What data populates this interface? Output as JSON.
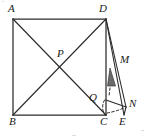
{
  "figure": {
    "width": 146,
    "height": 138,
    "background_color": "#ffffff",
    "stroke_color": "#2b2b2b",
    "shade_color": "#6b6b6b",
    "labels": {
      "a": "A",
      "b": "B",
      "c": "C",
      "d": "D",
      "e": "E",
      "m": "M",
      "n": "N",
      "p": "P",
      "q": "Q"
    },
    "points": {
      "A": {
        "x": 13,
        "y": 19
      },
      "B": {
        "x": 13,
        "y": 115
      },
      "C": {
        "x": 106,
        "y": 115
      },
      "D": {
        "x": 106,
        "y": 19
      },
      "E": {
        "x": 124,
        "y": 115
      },
      "N": {
        "x": 126,
        "y": 107
      },
      "P": {
        "x": 59.5,
        "y": 67
      },
      "Q": {
        "x": 106,
        "y": 100
      },
      "M": {
        "x": 117,
        "y": 76
      }
    },
    "label_positions": {
      "A": {
        "x": 8,
        "y": 4
      },
      "B": {
        "x": 9,
        "y": 118
      },
      "C": {
        "x": 101,
        "y": 118
      },
      "D": {
        "x": 101,
        "y": 4
      },
      "E": {
        "x": 120,
        "y": 118
      },
      "M": {
        "x": 121,
        "y": 55
      },
      "N": {
        "x": 129,
        "y": 99
      },
      "P": {
        "x": 58,
        "y": 49
      },
      "Q": {
        "x": 90,
        "y": 93
      }
    },
    "solid_segments": [
      {
        "name": "side-AB",
        "from": "A",
        "to": "B"
      },
      {
        "name": "side-BC",
        "from": "B",
        "to": "C"
      },
      {
        "name": "side-CD",
        "from": "C",
        "to": "D"
      },
      {
        "name": "side-DA",
        "from": "D",
        "to": "A"
      },
      {
        "name": "diagonal-AC",
        "from": "A",
        "to": "C"
      },
      {
        "name": "diagonal-BD",
        "from": "B",
        "to": "D"
      },
      {
        "name": "segment-DE",
        "from": "D",
        "to": "E"
      },
      {
        "name": "segment-DN",
        "from": "D",
        "to": "N"
      },
      {
        "name": "segment-NE",
        "from": "N",
        "to": "E"
      },
      {
        "name": "segment-QN",
        "from": "Q",
        "to": "N"
      }
    ],
    "dashed_segments": [
      {
        "name": "dashed-QC",
        "from": "Q",
        "to": "C"
      },
      {
        "name": "dashed-CN",
        "from": "C",
        "to": "N"
      }
    ],
    "shaded_region": {
      "name": "shaded-triangle-at-M",
      "vertices": [
        {
          "x": 110,
          "y": 68
        },
        {
          "x": 115,
          "y": 86
        },
        {
          "x": 108,
          "y": 86
        }
      ]
    }
  }
}
